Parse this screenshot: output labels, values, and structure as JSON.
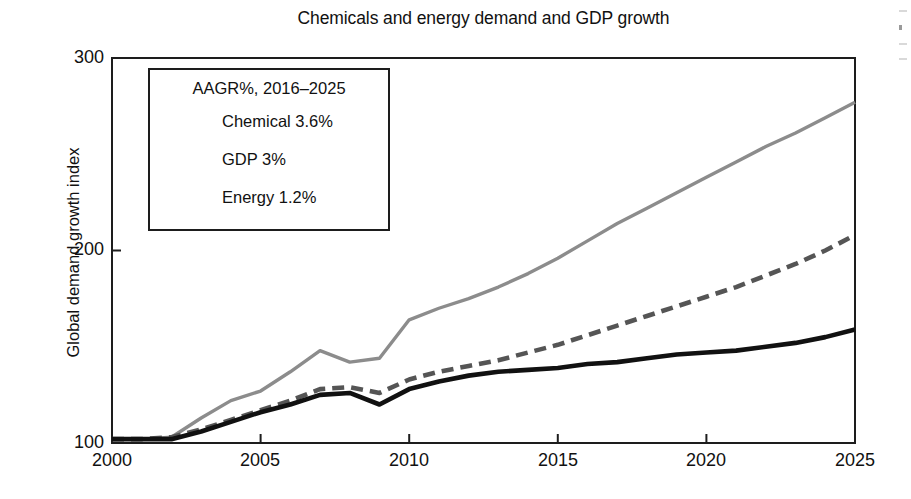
{
  "chart_data": {
    "type": "line",
    "title": "Chemicals and energy demand and GDP growth",
    "xlabel": "",
    "ylabel": "Global demand growth index",
    "xlim": [
      2000,
      2025
    ],
    "ylim": [
      100,
      300
    ],
    "yticks": [
      100,
      200,
      300
    ],
    "xticks": [
      2000,
      2005,
      2010,
      2015,
      2020,
      2025
    ],
    "grid": false,
    "legend_position": "upper-left-inside",
    "legend_title": "AAGR%, 2016–2025",
    "x": [
      2000,
      2001,
      2002,
      2003,
      2004,
      2005,
      2006,
      2007,
      2008,
      2009,
      2010,
      2011,
      2012,
      2013,
      2014,
      2015,
      2016,
      2017,
      2018,
      2019,
      2020,
      2021,
      2022,
      2023,
      2024,
      2025
    ],
    "series": [
      {
        "name": "Chemical 3.6%",
        "color": "#8c8c8c",
        "style": "solid",
        "values": [
          102,
          102,
          103,
          113,
          122,
          127,
          137,
          148,
          142,
          144,
          164,
          170,
          175,
          181,
          188,
          196,
          205,
          214,
          222,
          230,
          238,
          246,
          254,
          261,
          269,
          277
        ]
      },
      {
        "name": "GDP 3%",
        "color": "#555555",
        "style": "dashed",
        "values": [
          102,
          102,
          103,
          107,
          112,
          117,
          122,
          128,
          129,
          126,
          133,
          137,
          140,
          143,
          147,
          151,
          156,
          161,
          166,
          171,
          176,
          181,
          187,
          193,
          200,
          208
        ]
      },
      {
        "name": "Energy 1.2%",
        "color": "#111111",
        "style": "solid",
        "values": [
          102,
          102,
          102,
          106,
          111,
          116,
          120,
          125,
          126,
          120,
          128,
          132,
          135,
          137,
          138,
          139,
          141,
          142,
          144,
          146,
          147,
          148,
          150,
          152,
          155,
          159
        ]
      }
    ]
  },
  "axis": {
    "ytick_labels": [
      "300",
      "200",
      "100"
    ],
    "xtick_labels": [
      "2000",
      "2005",
      "2010",
      "2015",
      "2020",
      "2025"
    ]
  },
  "legend": {
    "title": "AAGR%, 2016–2025",
    "entries": [
      {
        "label": "Chemical 3.6%"
      },
      {
        "label": "GDP 3%"
      },
      {
        "label": "Energy 1.2%"
      }
    ]
  }
}
